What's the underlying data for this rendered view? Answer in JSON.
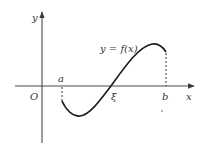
{
  "diagram": {
    "function_label": "y = f(x)",
    "axes": {
      "x_label": "x",
      "y_label": "y",
      "origin_label": "O"
    },
    "points": {
      "a_label": "a",
      "b_label": "b",
      "xi_label": "ξ"
    },
    "colors": {
      "axis": "#4a4a4a",
      "curve": "#1a1a1a",
      "dashed": "#333333",
      "text": "#333333"
    }
  }
}
